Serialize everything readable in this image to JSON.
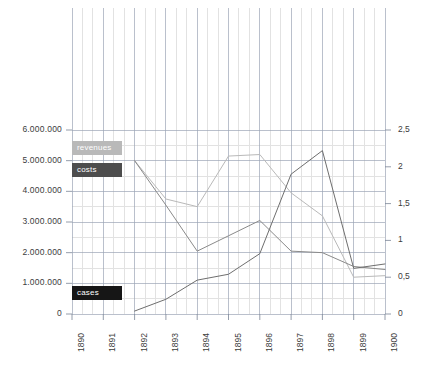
{
  "chart_data": {
    "type": "line",
    "title": "",
    "subtitle": "",
    "xlabel": "",
    "ylabel": "",
    "y2label": "",
    "grid": true,
    "legend_position": "inside-left",
    "x": [
      "1890",
      "1891",
      "1892",
      "1893",
      "1894",
      "1895",
      "1896",
      "1897",
      "1898",
      "1899",
      "1900"
    ],
    "xlim": [
      "1890",
      "1900"
    ],
    "ylim": [
      0,
      6000000
    ],
    "y2lim": [
      0,
      2.5
    ],
    "yticks": [
      0,
      1000000,
      2000000,
      3000000,
      4000000,
      5000000,
      6000000
    ],
    "ytick_labels": [
      "0",
      "1.000.000",
      "2.000.000",
      "3.000.000",
      "4.000.000",
      "5.000.000",
      "6.000.000"
    ],
    "y2ticks": [
      0,
      0.5,
      1,
      1.5,
      2,
      2.5
    ],
    "y2tick_labels": [
      "0",
      "0,5",
      "1",
      "1,5",
      "2",
      "2,5"
    ],
    "series": [
      {
        "name": "revenues",
        "axis": "left",
        "color": "#b9b9b9",
        "x": [
          "1892",
          "1893",
          "1894",
          "1895",
          "1896",
          "1897",
          "1898",
          "1899",
          "1900"
        ],
        "values": [
          5000000,
          3750000,
          3500000,
          5150000,
          5200000,
          3950000,
          3200000,
          1200000,
          1250000
        ]
      },
      {
        "name": "costs",
        "axis": "left",
        "color": "#8a8a8a",
        "x": [
          "1892",
          "1893",
          "1894",
          "1895",
          "1896",
          "1897",
          "1898",
          "1899",
          "1900"
        ],
        "values": [
          5000000,
          3550000,
          2050000,
          2550000,
          3050000,
          2050000,
          2000000,
          1550000,
          1450000
        ]
      },
      {
        "name": "cases",
        "axis": "right",
        "color": "#6e6e6e",
        "x": [
          "1892",
          "1893",
          "1894",
          "1895",
          "1896",
          "1897",
          "1898",
          "1899",
          "1900"
        ],
        "values": [
          0.04,
          0.2,
          0.46,
          0.54,
          0.82,
          1.9,
          2.22,
          0.62,
          0.68
        ]
      }
    ],
    "legend": [
      {
        "label": "revenues",
        "color": "#b9b9b9",
        "text_color": "#ffffff"
      },
      {
        "label": "costs",
        "color": "#4d4d4d",
        "text_color": "#ffffff"
      },
      {
        "label": "cases",
        "color": "#161616",
        "text_color": "#ffffff"
      }
    ]
  },
  "colors": {
    "grid_major": "#9aa4b5",
    "grid_minor": "#e2e2e2",
    "axis": "#7a8496",
    "background": "#ffffff",
    "tick_text": "#3c3c3c"
  }
}
